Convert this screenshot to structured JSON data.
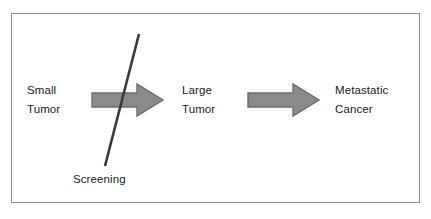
{
  "diagram": {
    "background_color": "#ffffff",
    "frame": {
      "border_color": "#8e8e8e",
      "fill_color": "#ffffff"
    },
    "stages": [
      {
        "id": "small-tumor",
        "line1": "Small",
        "line2": "Tumor"
      },
      {
        "id": "large-tumor",
        "line1": "Large",
        "line2": "Tumor"
      },
      {
        "id": "metastatic-cancer",
        "line1": "Metastatic",
        "line2": "Cancer"
      }
    ],
    "arrows": [
      {
        "id": "arrow-small-to-large",
        "direction": "right",
        "fill_color": "#8a8a8a",
        "stroke_color": "#6d6d6d"
      },
      {
        "id": "arrow-large-to-metastatic",
        "direction": "right",
        "fill_color": "#8a8a8a",
        "stroke_color": "#6d6d6d"
      }
    ],
    "intervention": {
      "id": "screening",
      "label": "Screening",
      "line_color": "#3a3a3a",
      "line_width": 2.6
    },
    "text_color": "#1b1b1b"
  }
}
